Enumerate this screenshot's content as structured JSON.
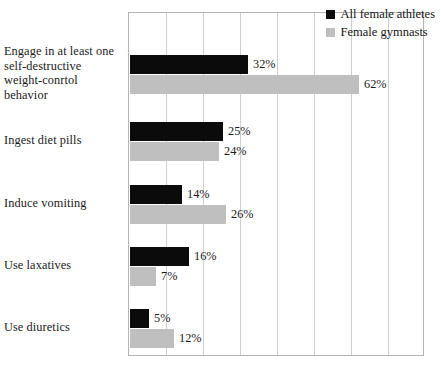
{
  "chart_data": {
    "type": "bar",
    "orientation": "horizontal",
    "title": "",
    "subtitle": "",
    "xlabel": "",
    "ylabel": "",
    "xlim": [
      0,
      80
    ],
    "grid": true,
    "grid_step": 10,
    "value_suffix": "%",
    "legend_position": "top-right",
    "categories": [
      "Engage in at least one self-destructive weight-conrtol behavior",
      "Ingest diet pills",
      "Induce vomiting",
      "Use laxatives",
      "Use diuretics"
    ],
    "series": [
      {
        "name": "All female athletes",
        "color": "#0b0b0b",
        "values": [
          32,
          25,
          14,
          16,
          5
        ],
        "labels": [
          "32%",
          "25%",
          "14%",
          "16%",
          "5%"
        ]
      },
      {
        "name": "Female gymnasts",
        "color": "#bfbfbf",
        "values": [
          62,
          24,
          26,
          7,
          12
        ],
        "labels": [
          "62%",
          "24%",
          "26%",
          "7%",
          "12%"
        ]
      }
    ]
  },
  "legend": {
    "items": [
      {
        "label": "All female athletes",
        "swatch": "dark"
      },
      {
        "label": "Female gymnasts",
        "swatch": "light"
      }
    ]
  },
  "category_label_lines": [
    [
      "Engage in at least one",
      "self-destructive",
      "weight-conrtol",
      "behavior"
    ],
    [
      "Ingest diet pills"
    ],
    [
      "Induce vomiting"
    ],
    [
      "Use laxatives"
    ],
    [
      "Use diuretics"
    ]
  ]
}
